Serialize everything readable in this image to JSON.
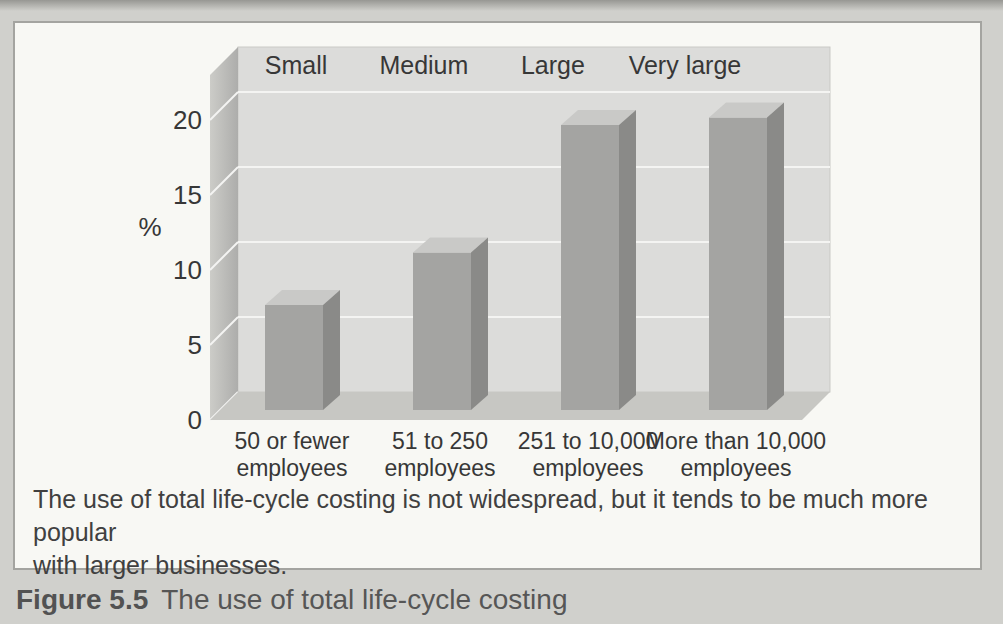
{
  "panel": {
    "caption_lines": [
      "The use of total life-cycle costing is not widespread, but it tends to be much more popular",
      "with larger businesses."
    ]
  },
  "page": {
    "figure_label": "Figure 5.5",
    "figure_title": "The use of total life-cycle costing"
  },
  "chart_data": {
    "type": "bar",
    "variant": "3d-column",
    "title": "",
    "xlabel": "",
    "ylabel": "%",
    "ylim": [
      0,
      20
    ],
    "ytick_step": 5,
    "yticks": [
      "0",
      "5",
      "10",
      "15",
      "20"
    ],
    "grid": true,
    "legend_position": "none",
    "group_labels": [
      "Small",
      "Medium",
      "Large",
      "Very large"
    ],
    "categories": [
      [
        "50 or fewer",
        "employees"
      ],
      [
        "51 to 250",
        "employees"
      ],
      [
        "251 to 10,000",
        "employees"
      ],
      [
        "More than 10,000",
        "employees"
      ]
    ],
    "values": [
      7,
      10.5,
      19,
      19.5
    ],
    "colors": {
      "bar_front": "#a4a4a2",
      "bar_side": "#8a8a88",
      "bar_top": "#c9c9c7",
      "wall": "#dcdcda",
      "wall_side_light": "#ccccc8",
      "wall_side_dark": "#adadab",
      "floor": "#c7c7c3",
      "gridline": "#f4f4f2",
      "text": "#373737"
    }
  }
}
